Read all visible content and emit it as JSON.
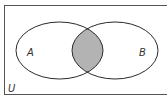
{
  "diagram": {
    "type": "venn",
    "universe_label": "U",
    "sets": [
      {
        "label": "A"
      },
      {
        "label": "B"
      }
    ],
    "shaded_region": "A ∩ B",
    "colors": {
      "stroke": "#2a2a2a",
      "shade": "#b3b3b3",
      "background": "#ffffff",
      "border": "#555555"
    }
  }
}
